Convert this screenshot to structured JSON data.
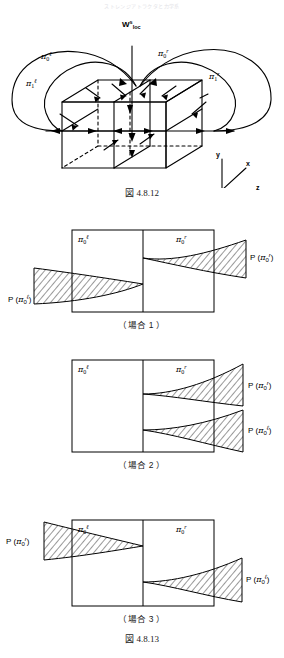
{
  "running_header": "ストレンジアトラクタと力学系",
  "figure_top": {
    "caption": "図 4.8.12",
    "labels": {
      "w_base": "W",
      "w_sup": "s",
      "w_sub": "loc",
      "pi_0_l": {
        "sym": "π",
        "sub": "0",
        "sup": "ℓ"
      },
      "pi_0_r": {
        "sym": "π",
        "sub": "0",
        "sup": "r"
      },
      "pi_1_l": {
        "sym": "π",
        "sub": "1",
        "sup": "ℓ"
      },
      "pi_1_r": {
        "sym": "π",
        "sub": "1",
        "sup": "r"
      }
    },
    "axes": {
      "y": "y",
      "x": "x",
      "z": "z"
    }
  },
  "figure_bottom": {
    "caption": "図 4.8.13",
    "cases": [
      {
        "id": "case-1",
        "subcaption": "（場合 1 ）",
        "box_labels": [
          {
            "sym": "π",
            "sub": "0",
            "sup": "ℓ"
          },
          {
            "sym": "π",
            "sub": "0",
            "sup": "r"
          }
        ],
        "outer_labels": [
          {
            "side": "left",
            "text_p": "P",
            "sym": "π",
            "sub": "0",
            "sup": "ℓ"
          },
          {
            "side": "right",
            "text_p": "P",
            "sym": "π",
            "sub": "0",
            "sup": "r"
          }
        ]
      },
      {
        "id": "case-2",
        "subcaption": "（場合 2 ）",
        "box_labels": [
          {
            "sym": "π",
            "sub": "0",
            "sup": "ℓ"
          },
          {
            "sym": "π",
            "sub": "0",
            "sup": "r"
          }
        ],
        "outer_labels": [
          {
            "side": "right-top",
            "text_p": "P",
            "sym": "π",
            "sub": "0",
            "sup": "r"
          },
          {
            "side": "right-bottom",
            "text_p": "P",
            "sym": "π",
            "sub": "0",
            "sup": "ℓ"
          }
        ]
      },
      {
        "id": "case-3",
        "subcaption": "（場合 3 ）",
        "box_labels": [
          {
            "sym": "π",
            "sub": "0",
            "sup": "ℓ"
          },
          {
            "sym": "π",
            "sub": "0",
            "sup": "r"
          }
        ],
        "outer_labels": [
          {
            "side": "left",
            "text_p": "P",
            "sym": "π",
            "sub": "0",
            "sup": "r"
          },
          {
            "side": "right",
            "text_p": "P",
            "sym": "π",
            "sub": "0",
            "sup": "ℓ"
          }
        ]
      }
    ]
  }
}
